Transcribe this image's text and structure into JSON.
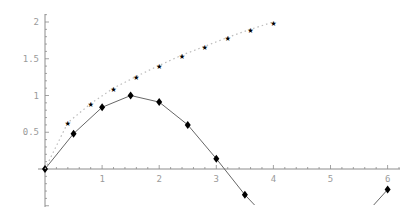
{
  "chart_data": {
    "type": "line",
    "title": "",
    "xlabel": "",
    "ylabel": "",
    "xlim": [
      -0.5,
      6.4
    ],
    "ylim": [
      -0.52,
      2.15
    ],
    "grid": false,
    "legend": null,
    "x_ticks": [
      "1",
      "2",
      "3",
      "4",
      "5",
      "6"
    ],
    "y_ticks": [
      "0.5",
      "1",
      "1.5",
      "2"
    ],
    "series": [
      {
        "name": "sin(x)",
        "marker": "diamond",
        "line": "solid",
        "x": [
          0,
          0.5,
          1.0,
          1.5,
          2.0,
          2.5,
          3.0,
          3.5,
          4.0,
          4.5,
          5.0,
          5.5,
          6.0
        ],
        "values": [
          0,
          0.48,
          0.84,
          1.0,
          0.91,
          0.6,
          0.14,
          -0.35,
          -0.76,
          -0.98,
          -0.96,
          -0.71,
          -0.28
        ]
      },
      {
        "name": "sqrt(x)",
        "marker": "star",
        "line": "dotted",
        "x": [
          0,
          0.4,
          0.8,
          1.2,
          1.6,
          2.0,
          2.4,
          2.8,
          3.2,
          3.6,
          4.0
        ],
        "values": [
          0,
          0.63,
          0.89,
          1.1,
          1.26,
          1.41,
          1.55,
          1.67,
          1.79,
          1.9,
          2.0
        ]
      }
    ]
  },
  "colors": {
    "axis": "#8c8c8c",
    "tick_text": "#9a9a9a",
    "sin_line": "#555555",
    "sqrt_line": "#bbbbbb",
    "marker": "#000000"
  }
}
